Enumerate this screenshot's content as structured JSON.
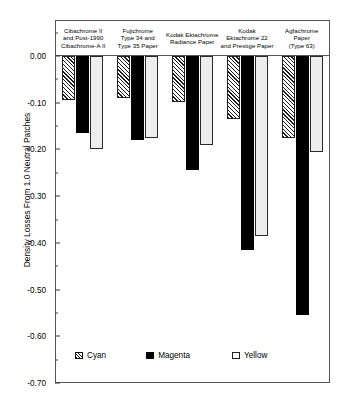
{
  "chart_data": {
    "type": "bar",
    "title": "",
    "subtitle": "",
    "xlabel": "",
    "ylabel": "Density Losses From 1.0 Neutral Patches",
    "ylim": [
      -0.7,
      0.0
    ],
    "ytick_step": 0.1,
    "ytick_labels": [
      "0.00",
      "-0.10",
      "-0.20",
      "-0.30",
      "-0.40",
      "-0.50",
      "-0.60",
      "-0.70"
    ],
    "ytick_values": [
      0.0,
      -0.1,
      -0.2,
      -0.3,
      -0.4,
      -0.5,
      -0.6,
      -0.7
    ],
    "minor_ticks": true,
    "grid": false,
    "legend_position": "bottom-left-inside",
    "orientation": "vertical",
    "bars_direction": "downward",
    "categories": [
      "Cibachrome II and Post-1990 Cibachrome-A II",
      "Fujichrome Type 34 and Type 35 Paper",
      "Kodak Ektachrome Radiance Paper",
      "Kodak Ektachrome 22 and Prestige Paper",
      "Agfachrome Paper (Type 63)"
    ],
    "category_label_lines": [
      [
        "Cibachrome II",
        "and Post-1990",
        "Cibachrome-A II"
      ],
      [
        "Fujichrome",
        "Type 34 and",
        "Type 35 Paper"
      ],
      [
        "Kodak Ektachrome",
        "Radiance Paper"
      ],
      [
        "Kodak",
        "Ektachrome 22",
        "and Prestige Paper"
      ],
      [
        "Agfachrome",
        "Paper",
        "(Type 63)"
      ]
    ],
    "series": [
      {
        "name": "Cyan",
        "fill": "hatched",
        "color": "#f2f2f2",
        "values": [
          -0.095,
          -0.09,
          -0.098,
          -0.135,
          -0.175
        ]
      },
      {
        "name": "Magenta",
        "fill": "solid-black",
        "color": "#000000",
        "values": [
          -0.165,
          -0.18,
          -0.245,
          -0.415,
          -0.555
        ]
      },
      {
        "name": "Yellow",
        "fill": "open-white",
        "color": "#ededed",
        "values": [
          -0.2,
          -0.175,
          -0.19,
          -0.385,
          -0.205
        ]
      }
    ]
  },
  "legend": {
    "items": [
      {
        "label": "Cyan"
      },
      {
        "label": "Magenta"
      },
      {
        "label": "Yellow"
      }
    ]
  }
}
